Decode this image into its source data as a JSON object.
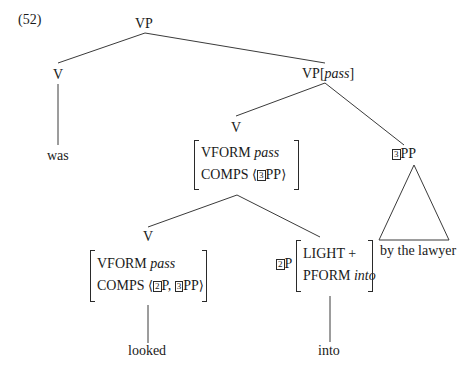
{
  "example_number": "(52)",
  "nodes": {
    "root": "VP",
    "aux_v": "V",
    "aux_word": "was",
    "vp_pass": {
      "cat": "VP",
      "feature": "pass"
    },
    "v_mid": "V",
    "pp": {
      "tag": "3",
      "cat": "PP",
      "yield": "by the lawyer"
    },
    "avm_mid": {
      "rows": [
        {
          "attr": "VFORM",
          "val": "pass"
        },
        {
          "attr": "COMPS",
          "list_open": "⟨",
          "tag": "3",
          "item": "PP",
          "list_close": "⟩"
        }
      ]
    },
    "v_low": "V",
    "avm_low": {
      "rows": [
        {
          "attr": "VFORM",
          "val": "pass"
        },
        {
          "attr": "COMPS",
          "list_open": "⟨",
          "tag1": "2",
          "item1": "P,",
          "tag2": "3",
          "item2": "PP",
          "list_close": "⟩"
        }
      ]
    },
    "verb_word": "looked",
    "p_node": {
      "tag": "2",
      "cat": "P"
    },
    "avm_p": {
      "rows": [
        {
          "attr": "LIGHT",
          "val": "+"
        },
        {
          "attr": "PFORM",
          "val": "into"
        }
      ]
    },
    "prep_word": "into"
  }
}
